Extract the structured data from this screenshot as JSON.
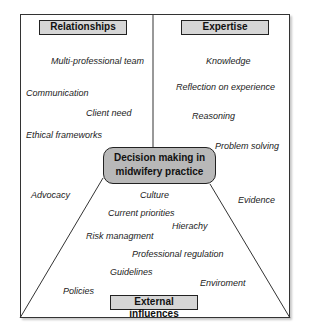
{
  "diagram": {
    "title": "Decision making in midwifery practice",
    "center": {
      "line1": "Decision making in",
      "line2": "midwifery practice"
    },
    "sections": {
      "relationships": {
        "header": "Relationships",
        "items": [
          "Multi-professional team",
          "Communication",
          "Client need",
          "Ethical frameworks",
          "Advocacy"
        ]
      },
      "expertise": {
        "header": "Expertise",
        "items": [
          "Knowledge",
          "Reflection on experience",
          "Reasoning",
          "Problem solving",
          "Evidence"
        ]
      },
      "external": {
        "header": "External influences",
        "items": [
          "Culture",
          "Current priorities",
          "Hierachy",
          "Risk managment",
          "Professional regulation",
          "Guidelines",
          "Enviroment",
          "Policies"
        ]
      }
    },
    "colors": {
      "header_fill": "#d6d6d6",
      "center_fill": "#b8b8b8",
      "stroke": "#222222"
    }
  }
}
